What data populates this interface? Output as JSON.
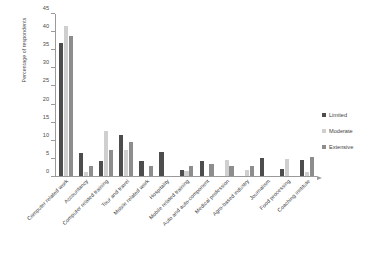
{
  "chart_data": {
    "type": "bar",
    "title": "",
    "xlabel": "",
    "ylabel": "Percentage of respondents",
    "ylim": [
      0,
      45
    ],
    "ytick_step": 5,
    "yticks": [
      "0",
      "5",
      "10",
      "15",
      "20",
      "25",
      "30",
      "35",
      "40",
      "45"
    ],
    "grid": false,
    "legend_position": "right",
    "categories": [
      "Computer related work",
      "Accountancy",
      "Computer related training",
      "Tour and travel",
      "Mobile related work",
      "Hospitality",
      "Mobile related training",
      "Auto and auto-component",
      "Medical profession",
      "Agro-based industry",
      "Journalism",
      "Food processing",
      "Coaching institute"
    ],
    "series": [
      {
        "name": "Limited",
        "color": "#4d4d4d",
        "values": [
          37.0,
          6.5,
          4.2,
          11.4,
          4.3,
          6.6,
          1.6,
          4.3,
          0.0,
          0.0,
          5.0,
          1.9,
          4.5
        ]
      },
      {
        "name": "Moderate",
        "color": "#cfcfcf",
        "values": [
          41.6,
          1.0,
          12.4,
          7.1,
          0.0,
          0.0,
          1.3,
          0.0,
          4.5,
          1.7,
          0.0,
          4.6,
          1.2
        ]
      },
      {
        "name": "Extensive",
        "color": "#8d8d8d",
        "values": [
          39.0,
          2.8,
          7.3,
          9.5,
          2.7,
          0.0,
          2.8,
          3.2,
          2.8,
          2.8,
          0.0,
          0.0,
          5.2
        ]
      }
    ]
  },
  "legend": {
    "items": [
      {
        "label": "Limited",
        "key": "limited"
      },
      {
        "label": "Moderate",
        "key": "moderate"
      },
      {
        "label": "Extensive",
        "key": "extensive"
      }
    ]
  }
}
